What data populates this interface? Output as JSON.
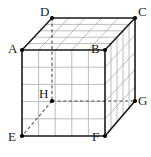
{
  "figure": {
    "name": "labelled-cube-diagram",
    "type": "3d-cube-oblique-projection",
    "background_color": "#ffffff",
    "edge_color": "#1a1a1a",
    "grid_color": "#b4b4b4",
    "hidden_edge_color": "#4d4d4d",
    "vertex_dot_color": "#000000",
    "grid_divisions": 5,
    "vertices": [
      {
        "id": "A",
        "label": "A",
        "x": 22,
        "y": 50,
        "visible": true,
        "label_x": 8,
        "label_y": 52
      },
      {
        "id": "B",
        "label": "B",
        "x": 105,
        "y": 50,
        "visible": true,
        "label_x": 91,
        "label_y": 52
      },
      {
        "id": "C",
        "label": "C",
        "x": 135,
        "y": 18,
        "visible": true,
        "label_x": 138,
        "label_y": 6
      },
      {
        "id": "D",
        "label": "D",
        "x": 52,
        "y": 18,
        "visible": true,
        "label_x": 40,
        "label_y": 6
      },
      {
        "id": "E",
        "label": "E",
        "x": 22,
        "y": 136,
        "visible": true,
        "label_x": 8,
        "label_y": 138
      },
      {
        "id": "F",
        "label": "F",
        "x": 105,
        "y": 136,
        "visible": true,
        "label_x": 92,
        "label_y": 138
      },
      {
        "id": "G",
        "label": "G",
        "x": 135,
        "y": 101,
        "visible": true,
        "label_x": 138,
        "label_y": 95
      },
      {
        "id": "H",
        "label": "H",
        "x": 52,
        "y": 101,
        "visible": false,
        "label_x": 39,
        "label_y": 88
      }
    ],
    "solid_edges": [
      [
        "A",
        "B"
      ],
      [
        "B",
        "F"
      ],
      [
        "F",
        "E"
      ],
      [
        "E",
        "A"
      ],
      [
        "A",
        "D"
      ],
      [
        "B",
        "C"
      ],
      [
        "F",
        "G"
      ],
      [
        "D",
        "C"
      ],
      [
        "C",
        "G"
      ]
    ],
    "dashed_edges": [
      [
        "D",
        "H"
      ],
      [
        "H",
        "G"
      ],
      [
        "H",
        "E"
      ]
    ],
    "faces": [
      {
        "id": "front",
        "corners": [
          "A",
          "B",
          "F",
          "E"
        ],
        "gridded": true
      },
      {
        "id": "top",
        "corners": [
          "D",
          "C",
          "B",
          "A"
        ],
        "gridded": true
      },
      {
        "id": "right",
        "corners": [
          "B",
          "C",
          "G",
          "F"
        ],
        "gridded": true
      }
    ]
  }
}
